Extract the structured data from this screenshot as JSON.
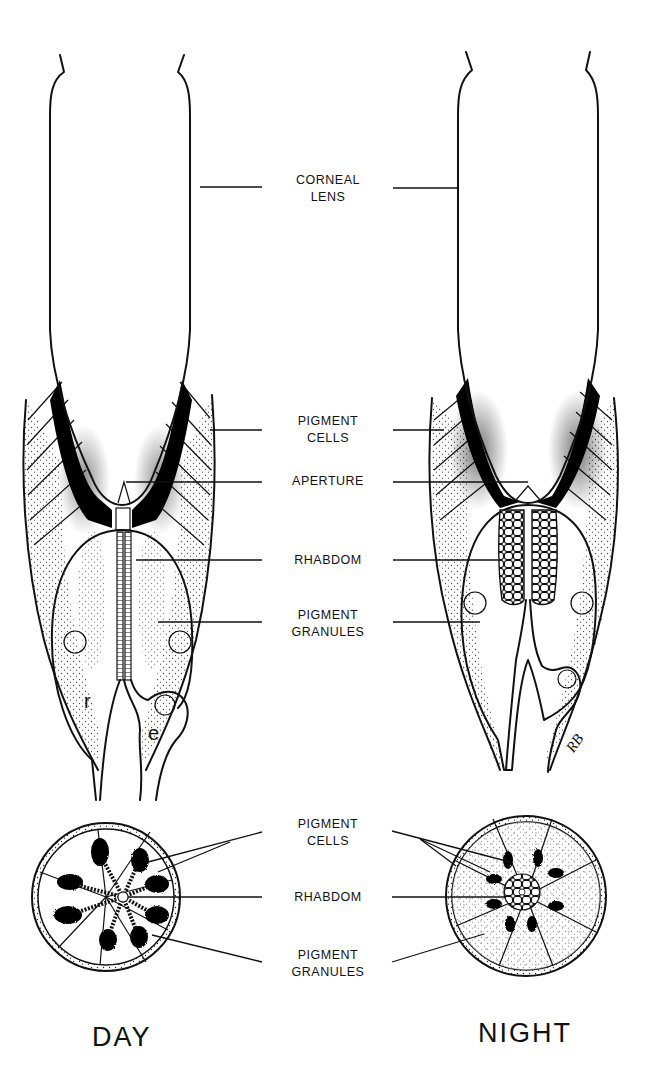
{
  "figure": {
    "columns": {
      "day": {
        "label": "DAY"
      },
      "night": {
        "label": "NIGHT"
      }
    },
    "longitudinal_labels": [
      {
        "id": "corneal-lens",
        "lines": [
          "CORNEAL",
          "LENS"
        ]
      },
      {
        "id": "pigment-cells",
        "lines": [
          "PIGMENT",
          "CELLS"
        ]
      },
      {
        "id": "aperture",
        "lines": [
          "APERTURE"
        ]
      },
      {
        "id": "rhabdom",
        "lines": [
          "RHABDOM"
        ]
      },
      {
        "id": "pigment-granules",
        "lines": [
          "PIGMENT",
          "GRANULES"
        ]
      }
    ],
    "cross_section_labels": [
      {
        "id": "pigment-cells",
        "lines": [
          "PIGMENT",
          "CELLS"
        ]
      },
      {
        "id": "rhabdom",
        "lines": [
          "RHABDOM"
        ]
      },
      {
        "id": "pigment-granules",
        "lines": [
          "PIGMENT",
          "GRANULES"
        ]
      }
    ],
    "cell_letters": {
      "retinula": "r",
      "eccentric": "e"
    },
    "artist_signature": "RB",
    "colors": {
      "ink": "#111111",
      "paper": "#ffffff"
    }
  }
}
